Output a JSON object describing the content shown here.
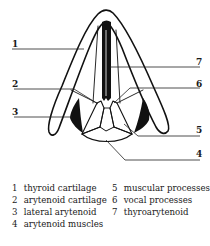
{
  "figure": {
    "callouts": [
      {
        "id": "1",
        "label": "1"
      },
      {
        "id": "2",
        "label": "2"
      },
      {
        "id": "3",
        "label": "3"
      },
      {
        "id": "4",
        "label": "4"
      },
      {
        "id": "5",
        "label": "5"
      },
      {
        "id": "6",
        "label": "6"
      },
      {
        "id": "7",
        "label": "7"
      }
    ]
  },
  "legend": {
    "items": [
      {
        "num": "1",
        "text": "thyroid cartilage"
      },
      {
        "num": "2",
        "text": "arytenoid cartilage"
      },
      {
        "num": "3",
        "text": "lateral arytenoid"
      },
      {
        "num": "4",
        "text": "arytenoid muscles"
      },
      {
        "num": "5",
        "text": "muscular processes"
      },
      {
        "num": "6",
        "text": "vocal processes"
      },
      {
        "num": "7",
        "text": "thyroarytenoid"
      }
    ]
  }
}
